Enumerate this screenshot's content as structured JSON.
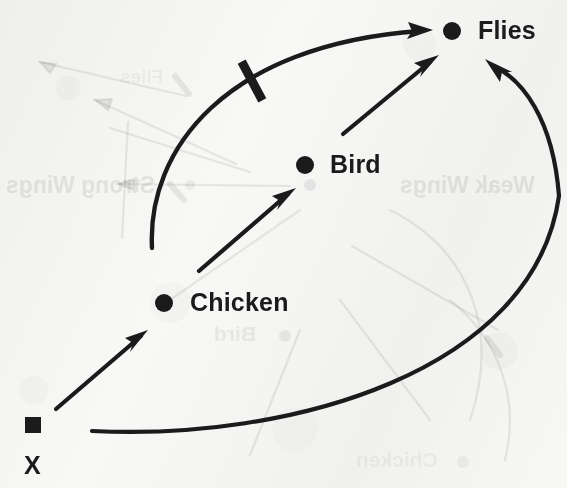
{
  "document": {
    "kind": "hand-drawn causal / inference diagram scan",
    "background_color": "#f8f8f7",
    "ink_color": "#1b1b1b",
    "width": 567,
    "height": 488
  },
  "nodes": [
    {
      "id": "flies",
      "label": "Flies",
      "marker": "filled-circle",
      "dot": {
        "cx": 452,
        "cy": 31,
        "r": 9
      },
      "label_pos": {
        "x": 478,
        "y": 16
      },
      "font_size": 25
    },
    {
      "id": "bird",
      "label": "Bird",
      "marker": "filled-circle",
      "dot": {
        "cx": 305,
        "cy": 165,
        "r": 9
      },
      "label_pos": {
        "x": 330,
        "y": 150
      },
      "font_size": 25
    },
    {
      "id": "chicken",
      "label": "Chicken",
      "marker": "filled-circle",
      "dot": {
        "cx": 164,
        "cy": 303,
        "r": 9
      },
      "label_pos": {
        "x": 190,
        "y": 288
      },
      "font_size": 25
    },
    {
      "id": "x",
      "label": "X",
      "marker": "filled-square",
      "square": {
        "x": 25,
        "y": 417,
        "size": 16
      },
      "label_pos": {
        "x": 24,
        "y": 451
      },
      "font_size": 25
    }
  ],
  "edges": [
    {
      "id": "x-to-chicken",
      "from": "x",
      "to": "chicken",
      "style": "straight-arrow",
      "relation": "supports",
      "path": "M 56 409 L 147 331",
      "head_at": {
        "x": 147,
        "y": 331
      },
      "head_angle_deg": -40
    },
    {
      "id": "chicken-to-bird",
      "from": "chicken",
      "to": "bird",
      "style": "straight-arrow",
      "relation": "supports",
      "path": "M 199 271 L 294 189",
      "head_at": {
        "x": 294,
        "y": 189
      },
      "head_angle_deg": -41
    },
    {
      "id": "bird-to-flies",
      "from": "bird",
      "to": "flies",
      "style": "straight-arrow",
      "relation": "supports",
      "path": "M 343 134 L 437 56",
      "head_at": {
        "x": 437,
        "y": 56
      },
      "head_angle_deg": -39
    },
    {
      "id": "chicken-to-flies-blocked",
      "from": "chicken",
      "to": "flies",
      "style": "curved-arrow-with-inhibition-bar",
      "relation": "blocked / negated",
      "path": "M 152 248 C 150 130, 250 34, 425 30",
      "head_at": {
        "x": 432,
        "y": 30
      },
      "head_angle_deg": -3,
      "inhibition_bar": {
        "cx": 252,
        "cy": 81,
        "length": 44,
        "thickness": 9,
        "angle_deg": 62
      }
    },
    {
      "id": "x-to-flies-long",
      "from": "x",
      "to": "flies",
      "style": "long-curved-arrow",
      "relation": "supports",
      "path": "M 92 431 C 300 440, 540 360, 558 190 C 551 112, 520 78, 490 62",
      "head_at": {
        "x": 487,
        "y": 60
      },
      "head_angle_deg": -122
    }
  ],
  "bleed_through": {
    "description": "mirrored show-through from the reverse page",
    "items": [
      {
        "text": "Strong Wings",
        "x": 6,
        "y": 172,
        "font_size": 23,
        "mirrored": true
      },
      {
        "text": "Weak Wings",
        "x": 400,
        "y": 172,
        "font_size": 23,
        "mirrored": true
      },
      {
        "text": "Bird",
        "x": 214,
        "y": 322,
        "font_size": 21,
        "mirrored": true
      },
      {
        "text": "Chicken",
        "x": 356,
        "y": 448,
        "font_size": 21,
        "mirrored": true
      },
      {
        "text": "Flies",
        "x": 120,
        "y": 66,
        "font_size": 19,
        "mirrored": true
      }
    ],
    "dots": [
      {
        "cx": 310,
        "cy": 185,
        "r": 6
      },
      {
        "cx": 285,
        "cy": 336,
        "r": 6
      },
      {
        "cx": 463,
        "cy": 462,
        "r": 6
      },
      {
        "cx": 190,
        "cy": 185,
        "r": 5
      }
    ]
  }
}
